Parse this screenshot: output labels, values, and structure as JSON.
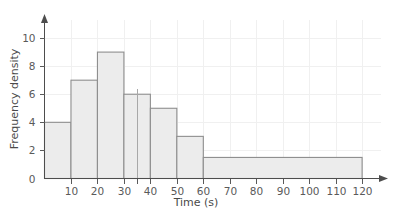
{
  "chart_data": {
    "type": "bar",
    "title": "",
    "subtitle": "",
    "xlabel": "Time (s)",
    "ylabel": "Frequency density",
    "xlim": [
      0,
      126
    ],
    "ylim": [
      0,
      11
    ],
    "grid": true,
    "legend": null,
    "x_tick_labels": [
      "10",
      "20",
      "30",
      "40",
      "50",
      "60",
      "70",
      "80",
      "90",
      "100",
      "110",
      "120"
    ],
    "x_tick_values": [
      10,
      20,
      30,
      40,
      50,
      60,
      70,
      80,
      90,
      100,
      110,
      120
    ],
    "x_extra_tick_values": [
      35
    ],
    "y_tick_labels": [
      "0",
      "2",
      "4",
      "6",
      "8",
      "10"
    ],
    "y_tick_values": [
      0,
      2,
      4,
      6,
      8,
      10
    ],
    "bar_fill": "#ececec",
    "bar_stroke": "#8e8e8e",
    "axis_color": "#4d4d4d",
    "grid_color": "#f0f0f0",
    "background": "#ffffff",
    "bins": [
      {
        "label": "0-10",
        "x0": 0,
        "x1": 10,
        "value": 4
      },
      {
        "label": "10-20",
        "x0": 10,
        "x1": 20,
        "value": 7
      },
      {
        "label": "20-30",
        "x0": 20,
        "x1": 30,
        "value": 9
      },
      {
        "label": "30-40",
        "x0": 30,
        "x1": 40,
        "value": 6
      },
      {
        "label": "40-50",
        "x0": 40,
        "x1": 50,
        "value": 5
      },
      {
        "label": "50-60",
        "x0": 50,
        "x1": 60,
        "value": 3
      },
      {
        "label": "60-120",
        "x0": 60,
        "x1": 120,
        "value": 1.5
      }
    ],
    "categories": [
      "0-10",
      "10-20",
      "20-30",
      "30-40",
      "40-50",
      "50-60",
      "60-120"
    ],
    "values": [
      4,
      7,
      9,
      6,
      5,
      3,
      1.5
    ]
  },
  "axes": {
    "x_title": "Time (s)",
    "y_title": "Frequency density"
  },
  "y_ticks": [
    {
      "label": "0"
    },
    {
      "label": "2"
    },
    {
      "label": "4"
    },
    {
      "label": "6"
    },
    {
      "label": "8"
    },
    {
      "label": "10"
    }
  ],
  "x_ticks": [
    {
      "label": "10"
    },
    {
      "label": "20"
    },
    {
      "label": "30"
    },
    {
      "label": "40"
    },
    {
      "label": "50"
    },
    {
      "label": "60"
    },
    {
      "label": "70"
    },
    {
      "label": "80"
    },
    {
      "label": "90"
    },
    {
      "label": "100"
    },
    {
      "label": "110"
    },
    {
      "label": "120"
    }
  ]
}
